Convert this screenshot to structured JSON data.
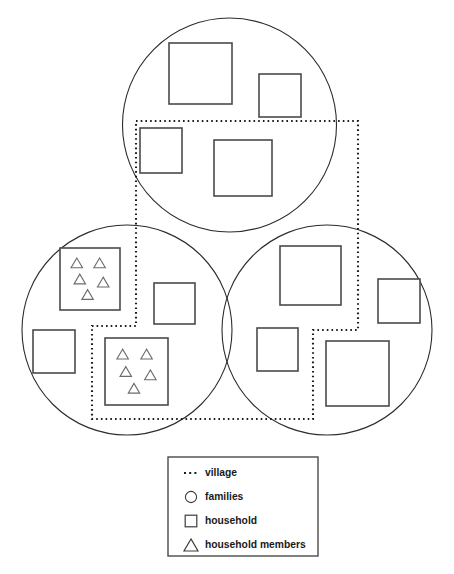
{
  "figure": {
    "background_color": "#ffffff",
    "width": 454,
    "height": 574
  },
  "style": {
    "circle_stroke": "#2b2b2b",
    "square_stroke": "#4a4a4a",
    "triangle_stroke": "#6b6b6b",
    "village_stroke": "#1c1c1c",
    "legend_text_color": "#1a1a1a"
  },
  "legend": {
    "box": {
      "x": 168,
      "y": 457,
      "width": 150,
      "height": 99
    },
    "items": [
      {
        "icon": "dotted-line-icon",
        "label": "village"
      },
      {
        "icon": "circle-icon",
        "label": "families"
      },
      {
        "icon": "square-icon",
        "label": "household"
      },
      {
        "icon": "triangle-icon",
        "label": "household members"
      }
    ]
  },
  "chart_data": {
    "type": "diagram",
    "families": [
      {
        "name": "family-top",
        "cx": 229.5,
        "cy": 125,
        "r": 107,
        "households": [
          {
            "name": "household-top-1",
            "x": 169,
            "y": 43,
            "width": 63,
            "height": 61,
            "members": 0
          },
          {
            "name": "household-top-2",
            "x": 259,
            "y": 74,
            "width": 42,
            "height": 43,
            "members": 0
          },
          {
            "name": "household-top-3",
            "x": 140,
            "y": 128,
            "width": 42,
            "height": 45,
            "members": 0
          },
          {
            "name": "household-top-4",
            "x": 214,
            "y": 140,
            "width": 58,
            "height": 56,
            "members": 0
          }
        ]
      },
      {
        "name": "family-left",
        "cx": 127,
        "cy": 330,
        "r": 105,
        "households": [
          {
            "name": "household-left-1",
            "x": 60,
            "y": 248,
            "width": 60,
            "height": 62,
            "members": 5
          },
          {
            "name": "household-left-2",
            "x": 154,
            "y": 283,
            "width": 41,
            "height": 41,
            "members": 0
          },
          {
            "name": "household-left-3",
            "x": 33,
            "y": 330,
            "width": 42,
            "height": 43,
            "members": 0
          },
          {
            "name": "household-left-4",
            "x": 105,
            "y": 338,
            "width": 63,
            "height": 67,
            "members": 5
          }
        ]
      },
      {
        "name": "family-right",
        "cx": 327,
        "cy": 330,
        "r": 105,
        "households": [
          {
            "name": "household-right-1",
            "x": 280,
            "y": 246,
            "width": 61,
            "height": 59,
            "members": 0
          },
          {
            "name": "household-right-2",
            "x": 378,
            "y": 279,
            "width": 42,
            "height": 44,
            "members": 0
          },
          {
            "name": "household-right-3",
            "x": 257,
            "y": 328,
            "width": 41,
            "height": 43,
            "members": 0
          },
          {
            "name": "household-right-4",
            "x": 326,
            "y": 341,
            "width": 63,
            "height": 65,
            "members": 0
          }
        ]
      }
    ],
    "totals": {
      "families": 3,
      "households": 12,
      "households_with_members_shown": 2,
      "members_per_shown_household": 5
    },
    "village_boundary": {
      "name": "village-boundary",
      "style": "dotted",
      "points": [
        [
          136,
          121
        ],
        [
          358,
          121
        ],
        [
          358,
          330
        ],
        [
          313,
          330
        ],
        [
          313,
          419
        ],
        [
          92,
          419
        ],
        [
          92,
          326
        ],
        [
          136,
          326
        ]
      ],
      "closed": true
    }
  }
}
